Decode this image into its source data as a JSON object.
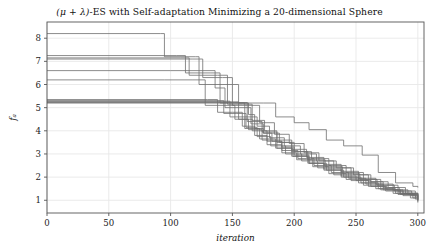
{
  "figure": {
    "width": 439,
    "height": 251,
    "background": "#ffffff"
  },
  "title": {
    "prefix": "(",
    "mu": "μ",
    "plus": " + ",
    "lambda": "λ",
    "suffix": ")-ES with Self-adaptation Minimizing a 20-dimensional Sphere",
    "full": "(μ + λ)-ES with Self-adaptation Minimizing a 20-dimensional Sphere"
  },
  "axes": {
    "x_label": "iteration",
    "y_label": "fₐ",
    "x_ticks": [
      "0",
      "50",
      "100",
      "150",
      "200",
      "250",
      "300"
    ],
    "y_ticks": [
      "1",
      "2",
      "3",
      "4",
      "5",
      "6",
      "7",
      "8"
    ],
    "grid": true,
    "grid_color": "#e8e8e8",
    "frame_color": "#555555",
    "plot_left": 47,
    "plot_top": 22,
    "plot_right": 424,
    "plot_bottom": 213
  },
  "chart_data": {
    "type": "line",
    "title": "(μ + λ)-ES with Self-adaptation Minimizing a 20-dimensional Sphere",
    "xlabel": "iteration",
    "ylabel": "fₐ",
    "xlim": [
      0,
      305
    ],
    "ylim": [
      0.45,
      8.7
    ],
    "grid": true,
    "legend": "none",
    "line_color": "#6e6e6e",
    "line_width": 0.8,
    "note": "Step-wise (staircase) monotone decreasing best-fitness traces, 12 independent runs of a (mu+lambda)-ES with self-adaptation on a 20-dimensional sphere function. Values are read off the axes; x is iteration, y is objective value f_a.",
    "series": [
      {
        "name": "run-1",
        "x": [
          0,
          92,
          95,
          120,
          123,
          150,
          155,
          163,
          168,
          175,
          182,
          190,
          200,
          212,
          224,
          238,
          250,
          262,
          275,
          288,
          300
        ],
        "values": [
          8.2,
          8.2,
          7.2,
          7.2,
          6.0,
          6.0,
          5.2,
          4.7,
          4.1,
          3.9,
          3.55,
          3.3,
          2.95,
          2.6,
          2.35,
          2.05,
          1.85,
          1.6,
          1.45,
          1.3,
          1.2
        ]
      },
      {
        "name": "run-2",
        "x": [
          0,
          105,
          112,
          132,
          140,
          152,
          160,
          170,
          180,
          192,
          205,
          218,
          232,
          246,
          260,
          272,
          285,
          300
        ],
        "values": [
          7.25,
          7.25,
          6.5,
          6.5,
          5.2,
          5.2,
          4.6,
          4.2,
          3.7,
          3.35,
          3.0,
          2.7,
          2.4,
          2.1,
          1.8,
          1.55,
          1.3,
          1.1
        ]
      },
      {
        "name": "run-3",
        "x": [
          0,
          108,
          115,
          138,
          146,
          158,
          166,
          176,
          186,
          198,
          210,
          224,
          238,
          252,
          266,
          280,
          292,
          300
        ],
        "values": [
          7.15,
          7.15,
          6.4,
          6.4,
          5.15,
          5.15,
          4.45,
          4.0,
          3.6,
          3.2,
          2.85,
          2.55,
          2.25,
          1.95,
          1.7,
          1.45,
          1.25,
          1.05
        ]
      },
      {
        "name": "run-4",
        "x": [
          0,
          118,
          126,
          142,
          150,
          162,
          172,
          184,
          196,
          208,
          220,
          234,
          248,
          262,
          276,
          290,
          300
        ],
        "values": [
          7.1,
          7.1,
          6.3,
          6.3,
          5.1,
          5.1,
          4.35,
          3.85,
          3.45,
          3.05,
          2.7,
          2.4,
          2.1,
          1.8,
          1.55,
          1.3,
          1.15
        ]
      },
      {
        "name": "run-5",
        "x": [
          0,
          100,
          110,
          136,
          144,
          156,
          165,
          175,
          188,
          200,
          214,
          228,
          242,
          256,
          270,
          284,
          298,
          300
        ],
        "values": [
          6.6,
          6.6,
          6.6,
          5.85,
          5.0,
          5.0,
          4.3,
          3.9,
          3.5,
          3.1,
          2.8,
          2.5,
          2.2,
          1.9,
          1.65,
          1.4,
          1.15,
          1.1
        ]
      },
      {
        "name": "run-6",
        "x": [
          0,
          95,
          118,
          128,
          140,
          152,
          163,
          174,
          186,
          199,
          212,
          226,
          240,
          254,
          268,
          282,
          296,
          300
        ],
        "values": [
          6.2,
          6.2,
          6.2,
          5.1,
          5.1,
          4.5,
          4.05,
          3.6,
          3.25,
          2.9,
          2.6,
          2.3,
          2.0,
          1.75,
          1.5,
          1.3,
          1.1,
          1.05
        ]
      },
      {
        "name": "run-7",
        "x": [
          0,
          130,
          138,
          150,
          158,
          168,
          178,
          190,
          202,
          215,
          228,
          242,
          256,
          270,
          284,
          298,
          300
        ],
        "values": [
          5.35,
          5.35,
          4.8,
          4.8,
          4.2,
          3.8,
          3.4,
          3.05,
          2.75,
          2.45,
          2.15,
          1.9,
          1.65,
          1.45,
          1.25,
          1.05,
          1.0
        ]
      },
      {
        "name": "run-8",
        "x": [
          0,
          135,
          143,
          153,
          161,
          170,
          181,
          193,
          206,
          219,
          232,
          246,
          260,
          274,
          288,
          300
        ],
        "values": [
          5.3,
          5.3,
          4.75,
          4.75,
          4.15,
          3.75,
          3.35,
          3.0,
          2.7,
          2.4,
          2.1,
          1.85,
          1.6,
          1.4,
          1.2,
          1.0
        ]
      },
      {
        "name": "run-9",
        "x": [
          0,
          140,
          148,
          160,
          172,
          185,
          198,
          211,
          224,
          238,
          252,
          266,
          280,
          294,
          300
        ],
        "values": [
          5.28,
          5.28,
          4.6,
          4.1,
          3.65,
          3.25,
          2.9,
          2.6,
          2.3,
          2.0,
          1.75,
          1.5,
          1.3,
          1.1,
          1.0
        ]
      },
      {
        "name": "run-10",
        "x": [
          0,
          145,
          155,
          166,
          178,
          190,
          203,
          216,
          230,
          244,
          258,
          272,
          286,
          300
        ],
        "values": [
          5.25,
          5.25,
          4.5,
          4.0,
          3.55,
          3.15,
          2.8,
          2.5,
          2.2,
          1.95,
          1.7,
          1.45,
          1.25,
          0.95
        ]
      },
      {
        "name": "run-11",
        "x": [
          0,
          175,
          185,
          200,
          212,
          226,
          240,
          255,
          268,
          282,
          296,
          300
        ],
        "values": [
          5.2,
          5.2,
          4.6,
          4.35,
          4.05,
          3.6,
          3.35,
          2.95,
          2.2,
          1.75,
          1.6,
          1.55
        ]
      },
      {
        "name": "run-12",
        "x": [
          0,
          152,
          162,
          174,
          186,
          198,
          211,
          225,
          239,
          253,
          267,
          281,
          295,
          300
        ],
        "values": [
          5.22,
          5.22,
          4.4,
          3.95,
          3.5,
          3.1,
          2.75,
          2.45,
          2.15,
          1.9,
          1.65,
          1.4,
          1.2,
          0.9
        ]
      }
    ]
  }
}
